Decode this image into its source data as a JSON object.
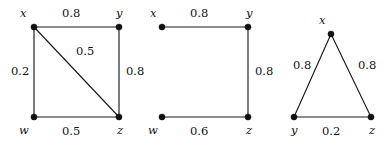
{
  "figure": {
    "background_color": "#ffffff",
    "ink_color": "#111111",
    "width": 388,
    "height": 147,
    "graph_count": 3
  },
  "graphs": [
    {
      "id": "graph-1",
      "name": "weighted-graph-1",
      "nodes": [
        {
          "id": "x",
          "label": "x",
          "cx": 34,
          "cy": 27,
          "label_x": 20,
          "label_y": 8
        },
        {
          "id": "y",
          "label": "y",
          "cx": 119,
          "cy": 27,
          "label_x": 116,
          "label_y": 8
        },
        {
          "id": "w",
          "label": "w",
          "cx": 34,
          "cy": 117,
          "label_x": 19,
          "label_y": 125
        },
        {
          "id": "z",
          "label": "z",
          "cx": 119,
          "cy": 117,
          "label_x": 117,
          "label_y": 125
        }
      ],
      "edges": [
        {
          "from": "x",
          "to": "y",
          "weight": "0.8",
          "label_x": 62,
          "label_y": 8
        },
        {
          "from": "x",
          "to": "w",
          "weight": "0.2",
          "label_x": 11,
          "label_y": 66
        },
        {
          "from": "w",
          "to": "z",
          "weight": "0.5",
          "label_x": 62,
          "label_y": 126
        },
        {
          "from": "y",
          "to": "z",
          "weight": "0.8",
          "label_x": 126,
          "label_y": 66
        },
        {
          "from": "x",
          "to": "z",
          "weight": "0.5",
          "label_x": 76,
          "label_y": 46
        }
      ]
    },
    {
      "id": "graph-2",
      "name": "weighted-graph-2",
      "nodes": [
        {
          "id": "x",
          "label": "x",
          "cx": 162,
          "cy": 27,
          "label_x": 150,
          "label_y": 8
        },
        {
          "id": "y",
          "label": "y",
          "cx": 248,
          "cy": 27,
          "label_x": 246,
          "label_y": 8
        },
        {
          "id": "w",
          "label": "w",
          "cx": 162,
          "cy": 117,
          "label_x": 148,
          "label_y": 125
        },
        {
          "id": "z",
          "label": "z",
          "cx": 248,
          "cy": 117,
          "label_x": 246,
          "label_y": 125
        }
      ],
      "edges": [
        {
          "from": "x",
          "to": "y",
          "weight": "0.8",
          "label_x": 190,
          "label_y": 8
        },
        {
          "from": "y",
          "to": "z",
          "weight": "0.8",
          "label_x": 255,
          "label_y": 66
        },
        {
          "from": "w",
          "to": "z",
          "weight": "0.6",
          "label_x": 190,
          "label_y": 126
        }
      ]
    },
    {
      "id": "graph-3",
      "name": "weighted-graph-3",
      "nodes": [
        {
          "id": "x",
          "label": "x",
          "cx": 331,
          "cy": 34,
          "label_x": 319,
          "label_y": 15
        },
        {
          "id": "y",
          "label": "y",
          "cx": 294,
          "cy": 117,
          "label_x": 291,
          "label_y": 125
        },
        {
          "id": "z",
          "label": "z",
          "cx": 371,
          "cy": 117,
          "label_x": 369,
          "label_y": 125
        }
      ],
      "edges": [
        {
          "from": "x",
          "to": "y",
          "weight": "0.8",
          "label_x": 293,
          "label_y": 60
        },
        {
          "from": "x",
          "to": "z",
          "weight": "0.8",
          "label_x": 358,
          "label_y": 60
        },
        {
          "from": "y",
          "to": "z",
          "weight": "0.2",
          "label_x": 322,
          "label_y": 126
        }
      ]
    }
  ],
  "chart_data": {
    "type": "diagram",
    "title": "",
    "diagram_kind": "weighted-undirected-graphs",
    "graphs": [
      {
        "name": "Graph 1",
        "vertices": [
          "x",
          "y",
          "w",
          "z"
        ],
        "edges": [
          {
            "u": "x",
            "v": "y",
            "weight": 0.8
          },
          {
            "u": "x",
            "v": "w",
            "weight": 0.2
          },
          {
            "u": "w",
            "v": "z",
            "weight": 0.5
          },
          {
            "u": "y",
            "v": "z",
            "weight": 0.8
          },
          {
            "u": "x",
            "v": "z",
            "weight": 0.5
          }
        ]
      },
      {
        "name": "Graph 2",
        "vertices": [
          "x",
          "y",
          "w",
          "z"
        ],
        "edges": [
          {
            "u": "x",
            "v": "y",
            "weight": 0.8
          },
          {
            "u": "y",
            "v": "z",
            "weight": 0.8
          },
          {
            "u": "w",
            "v": "z",
            "weight": 0.6
          }
        ]
      },
      {
        "name": "Graph 3",
        "vertices": [
          "x",
          "y",
          "z"
        ],
        "edges": [
          {
            "u": "x",
            "v": "y",
            "weight": 0.8
          },
          {
            "u": "x",
            "v": "z",
            "weight": 0.8
          },
          {
            "u": "y",
            "v": "z",
            "weight": 0.2
          }
        ]
      }
    ]
  }
}
